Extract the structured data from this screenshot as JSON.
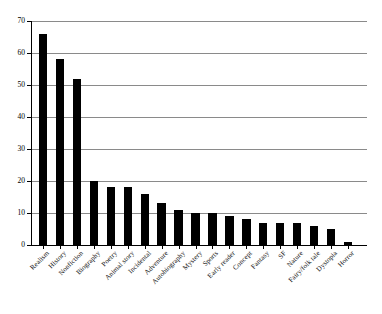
{
  "chart_data": {
    "type": "bar",
    "title": "",
    "subtitle": "",
    "xlabel": "",
    "ylabel": "",
    "ylim": [
      0,
      70
    ],
    "ytick_step": 10,
    "yticks": [
      0,
      10,
      20,
      30,
      40,
      50,
      60,
      70
    ],
    "ytick_labels": [
      "0",
      "10",
      "20",
      "30",
      "40",
      "50",
      "60",
      "70"
    ],
    "grid": "horizontal",
    "legend": "none",
    "bar_color": "#000000",
    "grid_color": "#8a8a8a",
    "axis_color": "#000000",
    "background": "#ffffff",
    "label_rotation_deg": -45,
    "categories": [
      "Realism",
      "History",
      "Nonfiction",
      "Biography",
      "Poetry",
      "Animal story",
      "Incidental",
      "Adventure",
      "Autobiography",
      "Mystery",
      "Sports",
      "Early reader",
      "Concept",
      "Fantasy",
      "SF",
      "Nature",
      "Fairy/folk tale",
      "Dystopia",
      "Horror"
    ],
    "values": [
      66,
      58,
      52,
      20,
      18,
      18,
      16,
      13,
      11,
      10,
      10,
      9,
      8,
      7,
      7,
      7,
      6,
      5,
      1
    ]
  }
}
